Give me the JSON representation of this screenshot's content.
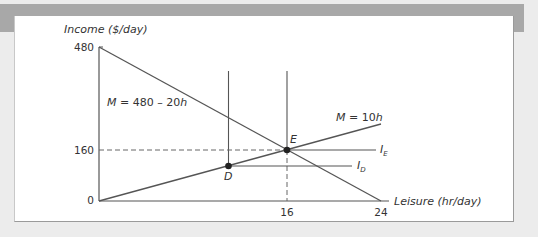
{
  "chart_data": {
    "type": "line",
    "title": "",
    "xlabel": "Leisure (hr/day)",
    "ylabel": "Income ($/day)",
    "xlim": [
      0,
      24
    ],
    "ylim": [
      0,
      480
    ],
    "x_ticks": [
      "0",
      "16",
      "24"
    ],
    "y_ticks": [
      "0",
      "160",
      "480"
    ],
    "grid": false,
    "series": [
      {
        "name": "M = 480 – 20h",
        "type": "budget-line",
        "points": [
          [
            0,
            480
          ],
          [
            24,
            0
          ]
        ]
      },
      {
        "name": "M = 10h",
        "type": "line",
        "points": [
          [
            0,
            0
          ],
          [
            24,
            240
          ]
        ]
      },
      {
        "name": "I_E",
        "type": "horizontal-segment",
        "points": [
          [
            16,
            160
          ],
          [
            23.5,
            160
          ]
        ]
      },
      {
        "name": "I_D",
        "type": "horizontal-segment",
        "points": [
          [
            11,
            110
          ],
          [
            21.5,
            110
          ]
        ]
      },
      {
        "name": "vertical-at-D",
        "type": "vertical-segment",
        "points": [
          [
            11,
            0
          ],
          [
            11,
            415
          ]
        ]
      },
      {
        "name": "vertical-at-E",
        "type": "vertical-segment",
        "points": [
          [
            16,
            160
          ],
          [
            16,
            415
          ]
        ]
      }
    ],
    "reference_lines": [
      {
        "axis": "y",
        "value": 160,
        "style": "dashed",
        "from_x": 0,
        "to_x": 16
      },
      {
        "axis": "x",
        "value": 16,
        "style": "dashed",
        "from_y": 0,
        "to_y": 160
      }
    ],
    "points": [
      {
        "label": "E",
        "x": 16,
        "y": 160
      },
      {
        "label": "D",
        "x": 11,
        "y": 110
      }
    ],
    "annotations": [
      "M = 480 – 20h",
      "M = 10h",
      "I_E",
      "I_D",
      "E",
      "D"
    ]
  },
  "labels": {
    "y_axis_title": "Income ($/day)",
    "x_axis_title": "Leisure (hr/day)",
    "y_480": "480",
    "y_160": "160",
    "y_0": "0",
    "x_16": "16",
    "x_24": "24",
    "budget_eq_prefix": "M = 480 – 20",
    "budget_eq_var": "h",
    "ray_eq_prefix": "M = 10",
    "ray_eq_var": "h",
    "point_e": "E",
    "point_d": "D",
    "ie_main": "I",
    "ie_sub": "E",
    "id_main": "I",
    "id_sub": "D"
  },
  "colors": {
    "line": "#555555",
    "text": "#333333",
    "frame_band": "#a8a8a8",
    "background": "#ececec"
  }
}
